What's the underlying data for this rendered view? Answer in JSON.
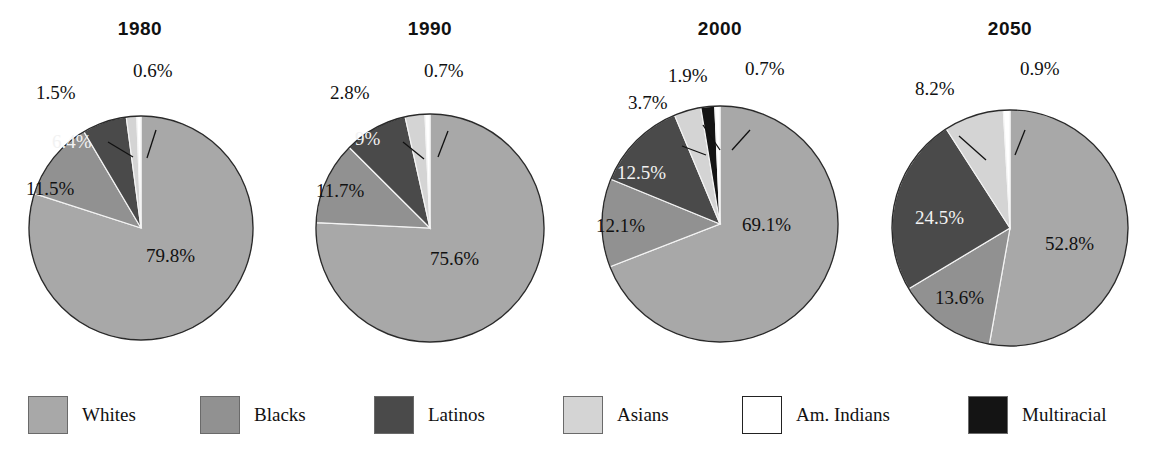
{
  "chart_data": {
    "type": "pie",
    "multiple": true,
    "categories": [
      "Whites",
      "Blacks",
      "Latinos",
      "Asians",
      "Am. Indians",
      "Multiracial"
    ],
    "colors": {
      "Whites": "#a8a8a8",
      "Blacks": "#919191",
      "Latinos": "#4a4a4a",
      "Asians": "#d4d4d4",
      "Am. Indians": "#ffffff",
      "Multiracial": "#141414"
    },
    "legend_position": "bottom",
    "grid": false,
    "panels": [
      {
        "title": "1980",
        "labels": [
          "Whites",
          "Blacks",
          "Latinos",
          "Asians",
          "Am. Indians"
        ],
        "values": [
          79.8,
          11.5,
          6.4,
          1.5,
          0.6
        ],
        "value_labels": [
          "79.8%",
          "11.5%",
          "6.4%",
          "1.5%",
          "0.6%"
        ]
      },
      {
        "title": "1990",
        "labels": [
          "Whites",
          "Blacks",
          "Latinos",
          "Asians",
          "Am. Indians"
        ],
        "values": [
          75.6,
          11.7,
          9.0,
          2.8,
          0.7
        ],
        "value_labels": [
          "75.6%",
          "11.7%",
          "9%",
          "2.8%",
          "0.7%"
        ]
      },
      {
        "title": "2000",
        "labels": [
          "Whites",
          "Blacks",
          "Latinos",
          "Asians",
          "Multiracial",
          "Am. Indians"
        ],
        "values": [
          69.1,
          12.1,
          12.5,
          3.7,
          1.9,
          0.7
        ],
        "value_labels": [
          "69.1%",
          "12.1%",
          "12.5%",
          "3.7%",
          "1.9%",
          "0.7%"
        ]
      },
      {
        "title": "2050",
        "labels": [
          "Whites",
          "Blacks",
          "Latinos",
          "Asians",
          "Am. Indians"
        ],
        "values": [
          52.8,
          13.6,
          24.5,
          8.2,
          0.9
        ],
        "value_labels": [
          "52.8%",
          "13.6%",
          "24.5%",
          "8.2%",
          "0.9%"
        ]
      }
    ]
  },
  "panels": {
    "p1980": {
      "title": "1980",
      "v_whites": "79.8%",
      "v_blacks": "11.5%",
      "v_latinos": "6.4%",
      "v_asians": "1.5%",
      "v_amindians": "0.6%"
    },
    "p1990": {
      "title": "1990",
      "v_whites": "75.6%",
      "v_blacks": "11.7%",
      "v_latinos": "9%",
      "v_asians": "2.8%",
      "v_amindians": "0.7%"
    },
    "p2000": {
      "title": "2000",
      "v_whites": "69.1%",
      "v_blacks": "12.1%",
      "v_latinos": "12.5%",
      "v_asians": "3.7%",
      "v_multiracial": "1.9%",
      "v_amindians": "0.7%"
    },
    "p2050": {
      "title": "2050",
      "v_whites": "52.8%",
      "v_blacks": "13.6%",
      "v_latinos": "24.5%",
      "v_asians": "8.2%",
      "v_amindians": "0.9%"
    }
  },
  "legend": {
    "items": [
      {
        "label": "Whites",
        "color": "#a8a8a8",
        "swatch": "filled"
      },
      {
        "label": "Blacks",
        "color": "#919191",
        "swatch": "filled"
      },
      {
        "label": "Latinos",
        "color": "#4a4a4a",
        "swatch": "filled"
      },
      {
        "label": "Asians",
        "color": "#d4d4d4",
        "swatch": "filled"
      },
      {
        "label": "Am. Indians",
        "color": "#ffffff",
        "swatch": "outline"
      },
      {
        "label": "Multiracial",
        "color": "#141414",
        "swatch": "filled"
      }
    ]
  }
}
